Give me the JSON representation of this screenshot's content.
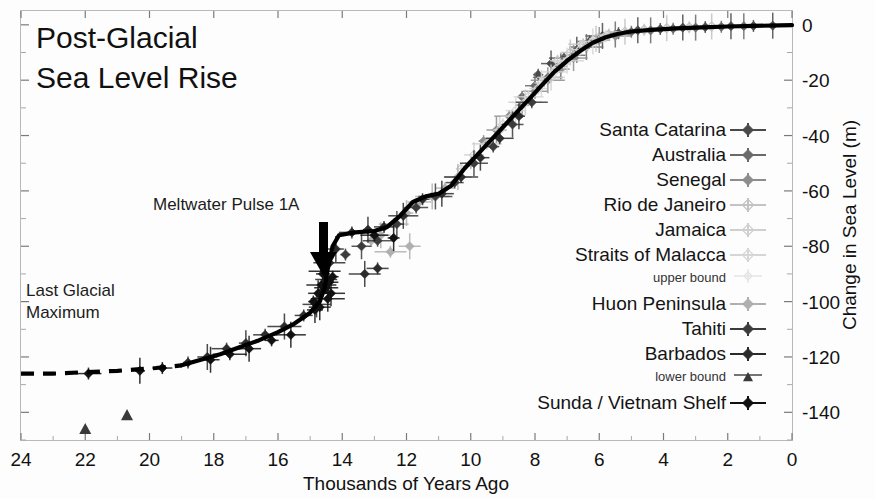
{
  "figure": {
    "title_line1": "Post-Glacial",
    "title_line2": "Sea Level Rise",
    "annotation_meltwater": "Meltwater Pulse 1A",
    "annotation_lgm_line1": "Last Glacial",
    "annotation_lgm_line2": "Maximum",
    "xlabel": "Thousands of Years Ago",
    "ylabel": "Change in Sea Level (m)"
  },
  "legend": {
    "entries": [
      {
        "label": "Santa Catarina",
        "marker": "diamond-with-errorbar-icon",
        "color": "#4a4a4a",
        "size": "normal"
      },
      {
        "label": "Australia",
        "marker": "diamond-with-errorbar-icon",
        "color": "#6a6a6a",
        "size": "normal"
      },
      {
        "label": "Senegal",
        "marker": "diamond-with-errorbar-icon",
        "color": "#8d8d8d",
        "size": "normal"
      },
      {
        "label": "Rio de Janeiro",
        "marker": "diamond-open-icon",
        "color": "#c3c3c3",
        "size": "normal"
      },
      {
        "label": "Jamaica",
        "marker": "diamond-open-icon",
        "color": "#cfcfcf",
        "size": "normal"
      },
      {
        "label": "Straits of Malacca",
        "marker": "diamond-open-icon",
        "color": "#d6d6d6",
        "size": "normal"
      },
      {
        "label": "upper bound",
        "marker": "diamond-open-small-icon",
        "color": "#e2e2e2",
        "size": "small"
      },
      {
        "label": "Huon Peninsula",
        "marker": "diamond-with-errorbar-icon",
        "color": "#b0b0b0",
        "size": "normal"
      },
      {
        "label": "Tahiti",
        "marker": "diamond-with-errorbar-icon",
        "color": "#3c3c3c",
        "size": "normal"
      },
      {
        "label": "Barbados",
        "marker": "diamond-with-errorbar-icon",
        "color": "#2b2b2b",
        "size": "normal"
      },
      {
        "label": "lower bound",
        "marker": "triangle-with-errorbar-icon",
        "color": "#3a3a3a",
        "size": "small"
      },
      {
        "label": "Sunda / Vietnam Shelf",
        "marker": "diamond-with-errorbar-icon",
        "color": "#111111",
        "size": "normal"
      }
    ]
  },
  "chart_data": {
    "type": "scatter",
    "title": "Post-Glacial Sea Level Rise",
    "xlabel": "Thousands of Years Ago",
    "ylabel": "Change in Sea Level (m)",
    "xlim": [
      24,
      0
    ],
    "ylim": [
      -150,
      5
    ],
    "x_ticks": [
      24,
      22,
      20,
      18,
      16,
      14,
      12,
      10,
      8,
      6,
      4,
      2,
      0
    ],
    "y_ticks": [
      0,
      -20,
      -40,
      -60,
      -80,
      -100,
      -120,
      -140
    ],
    "x_axis_reversed": true,
    "grid": false,
    "legend_position": "right-inside",
    "annotations": [
      {
        "text": "Meltwater Pulse 1A",
        "x": 15.6,
        "y": -62,
        "arrow_to_x": 14.5,
        "arrow_to_y": -90
      },
      {
        "text": "Last Glacial Maximum",
        "x": 22.2,
        "y": -100
      }
    ],
    "fitted_curve": {
      "name": "sea level best-fit",
      "solid_segment": [
        [
          19.0,
          -123
        ],
        [
          18.4,
          -121
        ],
        [
          17.8,
          -119
        ],
        [
          17.2,
          -116.5
        ],
        [
          16.6,
          -114
        ],
        [
          16.0,
          -111
        ],
        [
          15.5,
          -108
        ],
        [
          15.0,
          -104
        ],
        [
          14.7,
          -100
        ],
        [
          14.55,
          -95
        ],
        [
          14.45,
          -88
        ],
        [
          14.3,
          -80
        ],
        [
          14.1,
          -76
        ],
        [
          13.6,
          -75
        ],
        [
          13.0,
          -74.5
        ],
        [
          12.6,
          -73
        ],
        [
          12.2,
          -69
        ],
        [
          11.8,
          -64
        ],
        [
          11.4,
          -62
        ],
        [
          11.0,
          -61
        ],
        [
          10.6,
          -58
        ],
        [
          10.2,
          -52
        ],
        [
          9.8,
          -47
        ],
        [
          9.4,
          -42
        ],
        [
          9.0,
          -37
        ],
        [
          8.6,
          -32
        ],
        [
          8.2,
          -27
        ],
        [
          7.8,
          -22
        ],
        [
          7.4,
          -17
        ],
        [
          7.0,
          -13
        ],
        [
          6.6,
          -9.5
        ],
        [
          6.2,
          -6.5
        ],
        [
          5.8,
          -4.5
        ],
        [
          5.4,
          -3.2
        ],
        [
          5.0,
          -2.4
        ],
        [
          4.4,
          -1.8
        ],
        [
          3.6,
          -1.3
        ],
        [
          2.8,
          -0.9
        ],
        [
          2.0,
          -0.6
        ],
        [
          1.2,
          -0.4
        ],
        [
          0.4,
          -0.2
        ],
        [
          0.0,
          -0.1
        ]
      ],
      "dashed_segment": [
        [
          24.0,
          -126
        ],
        [
          23.0,
          -126
        ],
        [
          22.0,
          -125.5
        ],
        [
          21.0,
          -125
        ],
        [
          20.4,
          -124.5
        ],
        [
          19.8,
          -124
        ],
        [
          19.4,
          -123.5
        ],
        [
          19.0,
          -123
        ]
      ]
    },
    "series": [
      {
        "name": "Santa Catarina",
        "color": "#4a4a4a",
        "points": [
          [
            7.9,
            -18
          ],
          [
            7.5,
            -14
          ],
          [
            7.1,
            -12
          ],
          [
            6.7,
            -9
          ],
          [
            6.3,
            -6
          ],
          [
            5.9,
            -4
          ],
          [
            5.4,
            -3
          ],
          [
            4.8,
            -2
          ],
          [
            4.1,
            -1.5
          ],
          [
            3.4,
            -1
          ],
          [
            2.7,
            -0.8
          ],
          [
            1.9,
            -0.5
          ],
          [
            1.2,
            -0.4
          ],
          [
            0.6,
            -0.3
          ]
        ]
      },
      {
        "name": "Australia",
        "color": "#6a6a6a",
        "points": [
          [
            8.4,
            -26
          ],
          [
            8.0,
            -22
          ],
          [
            7.6,
            -19
          ],
          [
            7.2,
            -15
          ],
          [
            6.8,
            -11
          ],
          [
            6.4,
            -8
          ],
          [
            6.0,
            -5
          ],
          [
            5.5,
            -3.5
          ],
          [
            5.0,
            -2.5
          ],
          [
            4.4,
            -2
          ],
          [
            3.7,
            -1.4
          ],
          [
            3.0,
            -1
          ],
          [
            2.2,
            -0.7
          ],
          [
            1.5,
            -0.5
          ]
        ]
      },
      {
        "name": "Senegal",
        "color": "#8d8d8d",
        "points": [
          [
            9.6,
            -42
          ],
          [
            9.2,
            -38
          ],
          [
            8.8,
            -33
          ],
          [
            8.4,
            -29
          ],
          [
            8.0,
            -24
          ],
          [
            7.6,
            -20
          ],
          [
            7.2,
            -16
          ],
          [
            6.8,
            -12
          ],
          [
            6.4,
            -8
          ],
          [
            6.0,
            -5.5
          ],
          [
            5.5,
            -4
          ]
        ]
      },
      {
        "name": "Rio de Janeiro",
        "color": "#c3c3c3",
        "points": [
          [
            7.3,
            -13
          ],
          [
            6.9,
            -10
          ],
          [
            6.5,
            -7
          ],
          [
            6.1,
            -5
          ],
          [
            5.7,
            -3.5
          ],
          [
            5.2,
            -2.5
          ],
          [
            4.6,
            -1.8
          ],
          [
            3.9,
            -1.2
          ],
          [
            3.2,
            -0.9
          ],
          [
            2.5,
            -0.6
          ]
        ]
      },
      {
        "name": "Jamaica",
        "color": "#cfcfcf",
        "points": [
          [
            10.3,
            -52
          ],
          [
            9.9,
            -47
          ],
          [
            9.5,
            -43
          ],
          [
            9.1,
            -38
          ],
          [
            8.7,
            -33
          ],
          [
            8.3,
            -28
          ],
          [
            7.9,
            -23
          ],
          [
            7.5,
            -19
          ],
          [
            7.1,
            -14
          ]
        ]
      },
      {
        "name": "Straits of Malacca",
        "color": "#d6d6d6",
        "points": [
          [
            9.0,
            -36
          ],
          [
            8.6,
            -31
          ],
          [
            8.2,
            -26
          ],
          [
            7.8,
            -21
          ],
          [
            7.4,
            -17
          ],
          [
            7.0,
            -13
          ],
          [
            6.6,
            -9
          ],
          [
            6.2,
            -6
          ],
          [
            5.8,
            -4
          ]
        ]
      },
      {
        "name": "Huon Peninsula",
        "color": "#b0b0b0",
        "points": [
          [
            13.1,
            -78
          ],
          [
            12.8,
            -76
          ],
          [
            12.4,
            -72
          ],
          [
            12.0,
            -68
          ],
          [
            11.6,
            -64
          ],
          [
            11.2,
            -62
          ],
          [
            10.8,
            -59
          ],
          [
            10.4,
            -55
          ],
          [
            10.0,
            -50
          ],
          [
            11.9,
            -80
          ],
          [
            12.5,
            -82
          ]
        ]
      },
      {
        "name": "Tahiti",
        "color": "#3c3c3c",
        "points": [
          [
            13.9,
            -83
          ],
          [
            13.4,
            -80
          ],
          [
            12.9,
            -78
          ],
          [
            12.3,
            -72
          ],
          [
            11.7,
            -66
          ],
          [
            11.1,
            -62
          ],
          [
            10.5,
            -57
          ],
          [
            9.9,
            -50
          ],
          [
            9.3,
            -44
          ],
          [
            8.7,
            -36
          ],
          [
            8.1,
            -28
          ]
        ]
      },
      {
        "name": "Barbados",
        "color": "#2b2b2b",
        "points": [
          [
            18.8,
            -122
          ],
          [
            18.2,
            -120
          ],
          [
            17.6,
            -117
          ],
          [
            17.0,
            -115
          ],
          [
            16.4,
            -112
          ],
          [
            15.8,
            -109
          ],
          [
            15.2,
            -105
          ],
          [
            14.8,
            -101
          ],
          [
            14.6,
            -96
          ],
          [
            14.5,
            -92
          ],
          [
            14.4,
            -86
          ],
          [
            14.2,
            -81
          ],
          [
            13.7,
            -75
          ],
          [
            13.2,
            -74
          ],
          [
            12.7,
            -73
          ],
          [
            12.1,
            -69
          ],
          [
            11.5,
            -63
          ],
          [
            10.9,
            -61
          ],
          [
            10.3,
            -55
          ],
          [
            9.7,
            -48
          ],
          [
            9.1,
            -41
          ],
          [
            8.5,
            -33
          ],
          [
            12.9,
            -88
          ],
          [
            13.3,
            -90
          ]
        ]
      },
      {
        "name": "lower bound",
        "color": "#3a3a3a",
        "marker": "triangle",
        "points": [
          [
            22.0,
            -146
          ],
          [
            20.7,
            -141
          ]
        ]
      },
      {
        "name": "Sunda / Vietnam Shelf",
        "color": "#111111",
        "points": [
          [
            14.9,
            -100
          ],
          [
            14.75,
            -97
          ],
          [
            14.65,
            -94
          ],
          [
            14.6,
            -90
          ],
          [
            14.5,
            -95
          ],
          [
            14.45,
            -99
          ],
          [
            14.4,
            -93
          ],
          [
            14.35,
            -97
          ],
          [
            14.3,
            -91
          ],
          [
            14.7,
            -102
          ],
          [
            14.55,
            -89
          ],
          [
            14.85,
            -103
          ],
          [
            21.9,
            -126
          ],
          [
            20.3,
            -125
          ],
          [
            19.6,
            -124
          ],
          [
            15.6,
            -112
          ],
          [
            16.2,
            -114
          ],
          [
            16.9,
            -117
          ],
          [
            17.5,
            -119
          ],
          [
            18.1,
            -121
          ],
          [
            13.0,
            -76
          ],
          [
            12.4,
            -77
          ]
        ]
      }
    ]
  }
}
